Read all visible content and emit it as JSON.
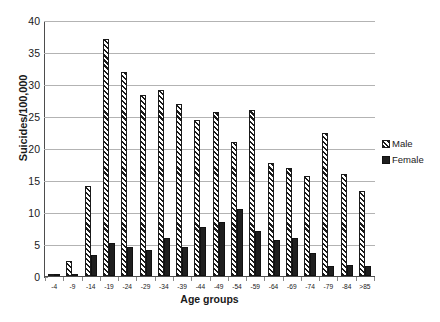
{
  "chart_data": {
    "type": "bar",
    "title": "",
    "subtitle": "",
    "xlabel": "Age groups",
    "ylabel": "Suicides/100,000",
    "categories": [
      "-4",
      "-9",
      "-14",
      "-19",
      "-24",
      "-29",
      "-34",
      "-39",
      "-44",
      "-49",
      "-54",
      "-59",
      "-64",
      "-69",
      "-74",
      "-79",
      "-84",
      ">85"
    ],
    "series": [
      {
        "name": "Male",
        "pattern": "diagonal-hatch",
        "color": "#1a1a1a",
        "values": [
          0.1,
          2.4,
          14.1,
          37.1,
          31.8,
          28.3,
          29.1,
          26.8,
          24.4,
          25.6,
          20.9,
          26.0,
          17.7,
          16.9,
          15.7,
          22.3,
          15.9,
          13.3
        ]
      },
      {
        "name": "Female",
        "pattern": "solid",
        "color": "#1f1f1f",
        "values": [
          0.1,
          0.2,
          3.3,
          5.2,
          4.5,
          4.1,
          5.9,
          4.5,
          7.7,
          8.4,
          10.5,
          7.1,
          5.6,
          6.0,
          3.6,
          1.5,
          1.7,
          1.6
        ]
      }
    ],
    "ylim": [
      0,
      40
    ],
    "yticks": [
      0,
      5,
      10,
      15,
      20,
      25,
      30,
      35,
      40
    ],
    "ytick_labels": [
      "0",
      "5",
      "10",
      "15",
      "20",
      "25",
      "30",
      "35",
      "40"
    ],
    "grid": "horizontal",
    "legend_position": "right",
    "legend_entries": [
      "Male",
      "Female"
    ]
  },
  "caption_fragment": ""
}
